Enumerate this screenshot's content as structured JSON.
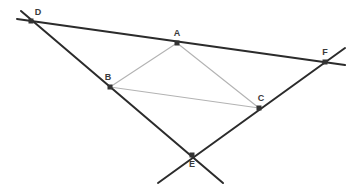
{
  "figure": {
    "title": "",
    "background_color": "#ffffff",
    "width": 359,
    "height": 194,
    "line_color_main": "#2b2b2b",
    "line_color_triangle": "#b3b3b3",
    "point_color": "#333333",
    "label_color": "#3a3a3a"
  },
  "chart_data": {
    "type": "diagram",
    "subtype": "euclidean-geometry-line-figure",
    "title": "",
    "xlabel": "",
    "ylabel": "",
    "xlim": [
      0,
      359
    ],
    "ylim": [
      194,
      0
    ],
    "grid": false,
    "legend": false,
    "points": [
      {
        "name": "A",
        "x": 177,
        "y": 43,
        "label": "A",
        "label_dx": 0,
        "label_dy": -7,
        "marker": "square",
        "anchor": "middle"
      },
      {
        "name": "B",
        "x": 110,
        "y": 87,
        "label": "B",
        "label_dx": -2,
        "label_dy": -7,
        "marker": "square",
        "anchor": "middle"
      },
      {
        "name": "C",
        "x": 259,
        "y": 108,
        "label": "C",
        "label_dx": 2,
        "label_dy": -7,
        "marker": "square",
        "anchor": "middle"
      },
      {
        "name": "D",
        "x": 31,
        "y": 21,
        "label": "D",
        "label_dx": 7,
        "label_dy": -6,
        "marker": "square",
        "anchor": "middle"
      },
      {
        "name": "E",
        "x": 192,
        "y": 155,
        "label": "E",
        "label_dx": 0,
        "label_dy": 12,
        "marker": "square",
        "anchor": "middle"
      },
      {
        "name": "F",
        "x": 325,
        "y": 62,
        "label": "F",
        "label_dx": 0,
        "label_dy": -7,
        "marker": "square",
        "anchor": "middle"
      }
    ],
    "segments": [
      {
        "name": "line-D-A-F",
        "through": [
          "D",
          "A",
          "F"
        ],
        "x1": 17,
        "y1": 19,
        "x2": 345,
        "y2": 65,
        "style": "main",
        "width": 2.0
      },
      {
        "name": "line-D-B-E",
        "through": [
          "D",
          "B",
          "E"
        ],
        "x1": 21,
        "y1": 11,
        "x2": 223,
        "y2": 183,
        "style": "main",
        "width": 2.0
      },
      {
        "name": "line-E-C-F",
        "through": [
          "E",
          "C",
          "F"
        ],
        "x1": 158,
        "y1": 183,
        "x2": 345,
        "y2": 48,
        "style": "main",
        "width": 2.0
      },
      {
        "name": "triangle-side-A-B",
        "through": [
          "A",
          "B"
        ],
        "x1": 177,
        "y1": 43,
        "x2": 110,
        "y2": 87,
        "style": "triangle",
        "width": 1.1
      },
      {
        "name": "triangle-side-A-C",
        "through": [
          "A",
          "C"
        ],
        "x1": 177,
        "y1": 43,
        "x2": 259,
        "y2": 108,
        "style": "triangle",
        "width": 1.1
      },
      {
        "name": "triangle-side-B-C",
        "through": [
          "B",
          "C"
        ],
        "x1": 110,
        "y1": 87,
        "x2": 259,
        "y2": 108,
        "style": "triangle",
        "width": 1.1
      }
    ],
    "annotations": []
  }
}
